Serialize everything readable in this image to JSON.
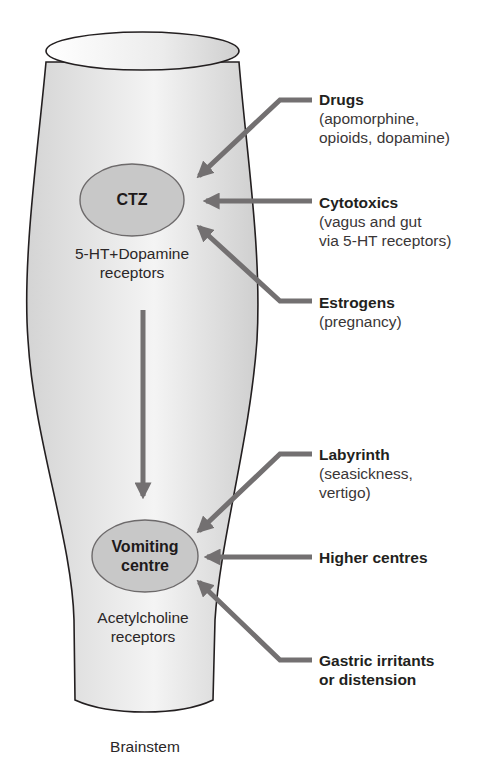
{
  "diagram": {
    "container_label": "Brainstem",
    "nodes": [
      {
        "id": "ctz",
        "label": "CTZ",
        "receptors_line1": "5-HT+Dopamine",
        "receptors_line2": "receptors"
      },
      {
        "id": "vomiting_centre",
        "label_line1": "Vomiting",
        "label_line2": "centre",
        "receptors_line1": "Acetylcholine",
        "receptors_line2": "receptors"
      }
    ],
    "edges": [
      {
        "from": "ctz",
        "to": "vomiting_centre"
      }
    ],
    "inputs_to_ctz": [
      {
        "title": "Drugs",
        "detail_line1": "(apomorphine,",
        "detail_line2": "opioids, dopamine)"
      },
      {
        "title": "Cytotoxics",
        "detail_line1": "(vagus and gut",
        "detail_line2": "via 5-HT receptors)"
      },
      {
        "title": "Estrogens",
        "detail_line1": "(pregnancy)"
      }
    ],
    "inputs_to_vomiting_centre": [
      {
        "title": "Labyrinth",
        "detail_line1": "(seasickness,",
        "detail_line2": "vertigo)"
      },
      {
        "title": "Higher centres"
      },
      {
        "title_line1": "Gastric irritants",
        "title_line2": "or distension"
      }
    ]
  },
  "colors": {
    "tube_fill": "#e6e6e6",
    "tube_stroke": "#231f20",
    "node_fill": "#c8c8c8",
    "node_stroke": "#6d6a6b",
    "arrow": "#737071",
    "text": "#231f20"
  }
}
